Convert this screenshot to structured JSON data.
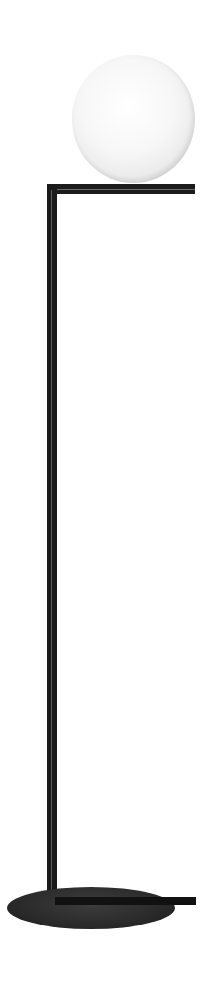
{
  "image": {
    "subject": "floor lamp",
    "description": "Black metal floor lamp with white opal glass globe on L-shaped arm, tall thin pole and round disc base",
    "colors": {
      "background": "#ffffff",
      "globe": "#f4f4f4",
      "metal": "#1a1a1a",
      "base": "#2e2e2e"
    }
  }
}
